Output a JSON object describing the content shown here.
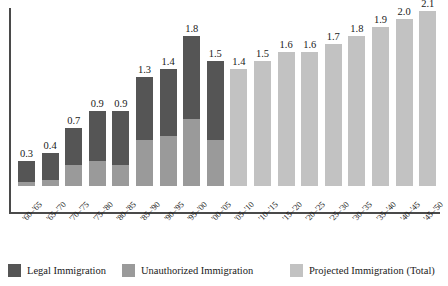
{
  "chart_data": {
    "type": "bar",
    "stacked": true,
    "title": "",
    "subtitle": "",
    "xlabel": "",
    "ylabel": "",
    "grid": false,
    "ylim": [
      0,
      2.3
    ],
    "legend_position": "bottom",
    "categories": [
      "'60–'65",
      "'65–'70",
      "'70–'75",
      "'75–'80",
      "'80–'85",
      "'85–'90",
      "'90–'95",
      "'95–'00",
      "'00–'05",
      "'05–'10",
      "'10–'15",
      "'15–'20",
      "'20–'25",
      "'25–'30",
      "'30–'35",
      "'35–'40",
      "'40–'45",
      "'45–'50"
    ],
    "totals": [
      0.3,
      0.4,
      0.7,
      0.9,
      0.9,
      1.3,
      1.4,
      1.8,
      1.5,
      1.4,
      1.5,
      1.6,
      1.6,
      1.7,
      1.8,
      1.9,
      2.0,
      2.1
    ],
    "series": [
      {
        "name": "Legal Immigration",
        "color": "#555555",
        "values": [
          0.25,
          0.33,
          0.45,
          0.6,
          0.65,
          0.75,
          0.8,
          1.0,
          0.95,
          null,
          null,
          null,
          null,
          null,
          null,
          null,
          null,
          null
        ]
      },
      {
        "name": "Unauthorized Immigration",
        "color": "#9a9a9a",
        "values": [
          0.05,
          0.07,
          0.25,
          0.3,
          0.25,
          0.55,
          0.6,
          0.8,
          0.55,
          null,
          null,
          null,
          null,
          null,
          null,
          null,
          null,
          null
        ]
      },
      {
        "name": "Projected Immigration (Total)",
        "color": "#c2c2c2",
        "values": [
          null,
          null,
          null,
          null,
          null,
          null,
          null,
          null,
          null,
          1.4,
          1.5,
          1.6,
          1.6,
          1.7,
          1.8,
          1.9,
          2.0,
          2.1
        ]
      }
    ],
    "value_labels": [
      "0.3",
      "0.4",
      "0.7",
      "0.9",
      "0.9",
      "1.3",
      "1.4",
      "1.8",
      "1.5",
      "1.4",
      "1.5",
      "1.6",
      "1.6",
      "1.7",
      "1.8",
      "1.9",
      "2.0",
      "2.1"
    ]
  },
  "legend": {
    "items": [
      {
        "label": "Legal Immigration",
        "color": "#555555"
      },
      {
        "label": "Unauthorized Immigration",
        "color": "#9a9a9a"
      },
      {
        "label": "Projected Immigration (Total)",
        "color": "#c2c2c2"
      }
    ]
  },
  "axis": {
    "y_axis_color": "#4a4a4a",
    "x_axis_color": "#4a4a4a"
  }
}
